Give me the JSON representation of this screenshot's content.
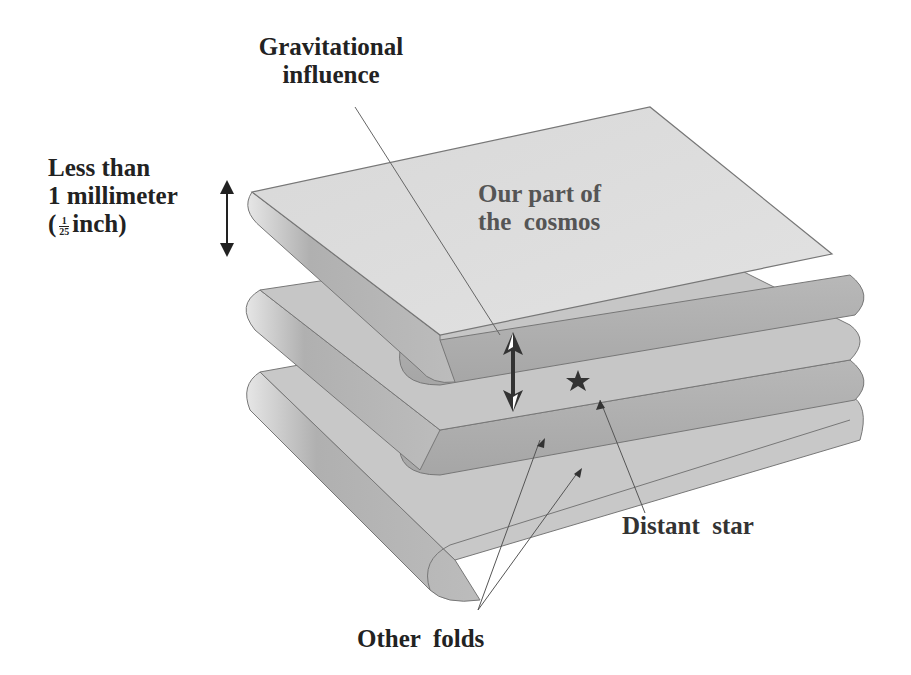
{
  "diagram": {
    "labels": {
      "gravitational_line1": "Gravitational",
      "gravitational_line2": "influence",
      "less_than_line1": "Less than",
      "less_than_line2": "1 millimeter",
      "less_than_paren_open": "(",
      "less_than_frac_num": "1",
      "less_than_frac_den": "25",
      "less_than_unit": "inch)",
      "our_part_line1": "Our part of",
      "our_part_line2": "the  cosmos",
      "distant_star": "Distant  star",
      "other_folds": "Other  folds"
    },
    "colors": {
      "sheet_light": "#dcdcdc",
      "sheet_dark": "#a8a8a8",
      "inner": "#b4b4b4",
      "text": "#222222"
    }
  }
}
